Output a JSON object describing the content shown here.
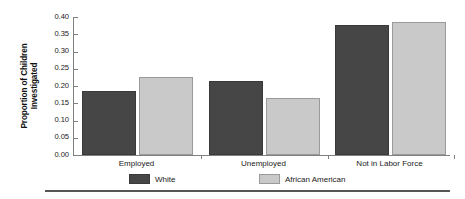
{
  "chart_data": {
    "type": "bar",
    "title": "",
    "subtitle": "",
    "xlabel": "",
    "ylabel": "Proportion of Children Investigated",
    "ylabel_lines": [
      "Proportion of Children",
      "Investigated"
    ],
    "categories": [
      "Employed",
      "Unemployed",
      "Not in Labor Force"
    ],
    "series": [
      {
        "name": "White",
        "color": "#464646",
        "values": [
          0.18,
          0.21,
          0.37
        ]
      },
      {
        "name": "African American",
        "color": "#c9c9c9",
        "values": [
          0.22,
          0.16,
          0.38
        ]
      }
    ],
    "ylim": [
      0.0,
      0.4
    ],
    "ytick_values": [
      0.4,
      0.35,
      0.3,
      0.25,
      0.2,
      0.15,
      0.1,
      0.05,
      0.0
    ],
    "ytick_labels": [
      "0.40",
      "0.35",
      "0.30",
      "0.25",
      "0.20",
      "0.15",
      "0.10",
      "0.05",
      "0.00"
    ],
    "grid": false,
    "legend_position": "bottom"
  },
  "legend": {
    "items": [
      {
        "label": "White"
      },
      {
        "label": "African American"
      }
    ]
  },
  "colors": {
    "series_white": "#464646",
    "series_african_american": "#c9c9c9",
    "axis": "#808080",
    "text": "#1a1a1a",
    "rule": "#555555",
    "background": "#ffffff"
  }
}
